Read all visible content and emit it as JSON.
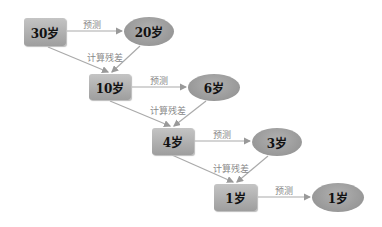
{
  "diagram": {
    "type": "residual-boosting-flow",
    "edge_labels": {
      "predict": "预测",
      "residual": "计算残差"
    },
    "rows": [
      {
        "input": "30岁",
        "prediction": "20岁"
      },
      {
        "input": "10岁",
        "prediction": "6岁"
      },
      {
        "input": "4岁",
        "prediction": "3岁"
      },
      {
        "input": "1岁",
        "prediction": "1岁"
      }
    ],
    "colors": {
      "node": "#a8a8a8",
      "edge": "#aaaaaa",
      "label": "#888888"
    }
  }
}
